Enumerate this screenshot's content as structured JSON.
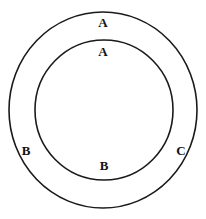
{
  "diagram": {
    "background_color": "#ffffff",
    "stroke_color": "#1a1a1a",
    "label_color": "#121212",
    "canvas": {
      "width": 206,
      "height": 219
    },
    "shapes": [
      {
        "name": "outer-circle",
        "type": "circle",
        "cx": 103,
        "cy": 110,
        "rx": 94,
        "ry": 98,
        "stroke_width": 1.6,
        "fill": "none"
      },
      {
        "name": "inner-circle",
        "type": "circle",
        "cx": 104,
        "cy": 110,
        "rx": 69,
        "ry": 70,
        "stroke_width": 1.6,
        "fill": "none"
      }
    ],
    "labels": [
      {
        "id": "label-a-outer-top",
        "text": "A",
        "x": 103,
        "y": 22,
        "font_size": 13,
        "region": "annulus-top"
      },
      {
        "id": "label-a-inner-top",
        "text": "A",
        "x": 103,
        "y": 51,
        "font_size": 13,
        "region": "inner-top"
      },
      {
        "id": "label-b-left",
        "text": "B",
        "x": 26,
        "y": 150,
        "font_size": 13,
        "region": "annulus-left"
      },
      {
        "id": "label-b-bottom",
        "text": "B",
        "x": 104,
        "y": 165,
        "font_size": 13,
        "region": "inner-bottom"
      },
      {
        "id": "label-c-right",
        "text": "C",
        "x": 181,
        "y": 150,
        "font_size": 13,
        "region": "annulus-right"
      }
    ]
  }
}
